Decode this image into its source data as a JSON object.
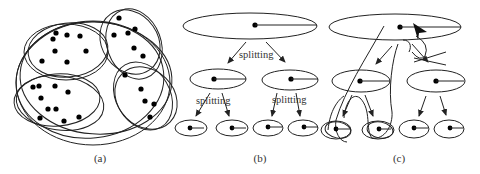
{
  "figure": {
    "panels": [
      {
        "id": "a",
        "caption": "(a)"
      },
      {
        "id": "b",
        "caption": "(b)",
        "edge_label_top": "splitting",
        "edge_label_left": "splitting",
        "edge_label_right": "splitting"
      },
      {
        "id": "c",
        "caption": "(c)"
      }
    ]
  },
  "colors": {
    "stroke": "#222222",
    "dot": "#000000",
    "background": "#ffffff"
  }
}
